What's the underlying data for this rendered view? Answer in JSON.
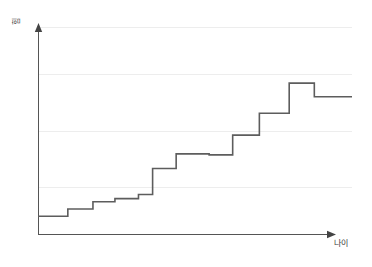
{
  "chart_data": {
    "type": "line",
    "title": "",
    "subtitle": "",
    "xlabel": "나이",
    "ylabel": "힘",
    "x_axis_label": "나이",
    "y_axis_label": "힘",
    "step_style": "step-post",
    "grid": true,
    "gridlines_count": 4,
    "legend": "none",
    "xlim": [
      0,
      100
    ],
    "ylim": [
      0,
      100
    ],
    "x_tick_labels": [],
    "y_tick_labels": [],
    "series": [
      {
        "name": "힘",
        "color": "#5d5d5d",
        "x": [
          0,
          9.5,
          17.5,
          24.5,
          32,
          36.5,
          44,
          54.5,
          62,
          70.5,
          80,
          88,
          100
        ],
        "values": [
          9,
          12.5,
          16,
          17.5,
          19.5,
          32,
          39,
          38.5,
          48,
          58.5,
          73,
          66.5,
          66.5
        ],
        "steps": [
          {
            "x_start": 0,
            "x_end": 9.5,
            "value": 9
          },
          {
            "x_start": 9.5,
            "x_end": 17.5,
            "value": 12.5
          },
          {
            "x_start": 17.5,
            "x_end": 24.5,
            "value": 16
          },
          {
            "x_start": 24.5,
            "x_end": 32,
            "value": 17.5
          },
          {
            "x_start": 32,
            "x_end": 36.5,
            "value": 19.5
          },
          {
            "x_start": 36.5,
            "x_end": 44,
            "value": 32
          },
          {
            "x_start": 44,
            "x_end": 54.5,
            "value": 39
          },
          {
            "x_start": 54.5,
            "x_end": 62,
            "value": 38.5
          },
          {
            "x_start": 62,
            "x_end": 70.5,
            "value": 48
          },
          {
            "x_start": 70.5,
            "x_end": 80,
            "value": 58.5
          },
          {
            "x_start": 80,
            "x_end": 88,
            "value": 73
          },
          {
            "x_start": 88,
            "x_end": 100,
            "value": 66.5
          }
        ]
      }
    ],
    "gridline_values": [
      100,
      77,
      50,
      23
    ],
    "colors": {
      "line": "#5d5d5d",
      "axis": "#555555",
      "grid": "#ededed",
      "background": "#ffffff",
      "label_text": "#3b3b3b"
    }
  }
}
